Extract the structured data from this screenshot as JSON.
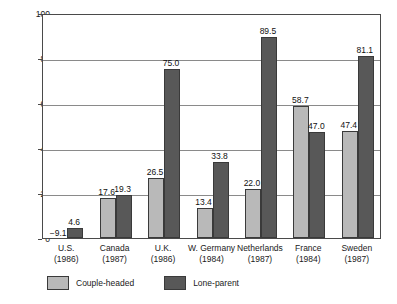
{
  "chart_data": {
    "type": "bar",
    "title": "",
    "xlabel": "",
    "ylabel": "Percent",
    "ylim": [
      0,
      100
    ],
    "yticks": [
      0,
      20,
      40,
      60,
      80,
      100
    ],
    "grid": true,
    "legend_position": "bottom-left",
    "categories": [
      "U.S.",
      "Canada",
      "U.K.",
      "W. Germany",
      "Netherlands",
      "France",
      "Sweden"
    ],
    "category_years": [
      "(1986)",
      "(1987)",
      "(1986)",
      "(1984)",
      "(1987)",
      "(1984)",
      "(1987)"
    ],
    "series": [
      {
        "name": "Couple-headed",
        "color": "#b9b9b9",
        "values": [
          -9.1,
          17.6,
          26.5,
          13.4,
          22.0,
          58.7,
          47.4
        ],
        "labels": [
          "−9.1",
          "17.6",
          "26.5",
          "13.4",
          "22.0",
          "58.7",
          "47.4"
        ]
      },
      {
        "name": "Lone-parent",
        "color": "#585858",
        "values": [
          4.6,
          19.3,
          75.0,
          33.8,
          89.5,
          47.0,
          81.1
        ],
        "labels": [
          "4.6",
          "19.3",
          "75.0",
          "33.8",
          "89.5",
          "47.0",
          "81.1"
        ]
      }
    ]
  },
  "axis": {
    "y_title": "Percent",
    "y_tick_labels": [
      "100",
      "80",
      "60",
      "40",
      "20",
      "0"
    ]
  },
  "legend": {
    "couple_label": "Couple-headed",
    "lone_label": "Lone-parent"
  }
}
